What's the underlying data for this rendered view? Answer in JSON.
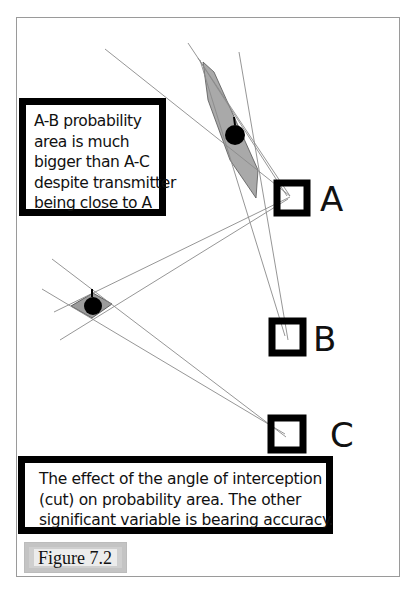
{
  "figure": {
    "caption_label": "Figure 7.2",
    "caption": [
      "The effect of the angle of interception",
      "(cut) on probability area.  The other",
      "significant variable is bearing accuracy."
    ],
    "note": [
      "A-B probability",
      "area is much",
      "bigger than A-C",
      "despite transmitter",
      "being close to A"
    ]
  },
  "stations": [
    {
      "id": "A",
      "label": "A"
    },
    {
      "id": "B",
      "label": "B"
    },
    {
      "id": "C",
      "label": "C"
    }
  ],
  "transmitters": [
    {
      "name": "transmitter-near-A",
      "probability_area": "A-B",
      "shape": "elongated sliver"
    },
    {
      "name": "transmitter-left",
      "probability_area": "A-C",
      "shape": "small diamond"
    }
  ],
  "colors": {
    "box_border": "#000000",
    "bearing_line": "#8a8a8a",
    "probability_fill": "#a8a8a8",
    "frame": "#9a9a9a",
    "figure_tag_bg": "#cfcfcf"
  }
}
